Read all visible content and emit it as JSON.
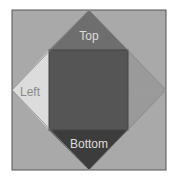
{
  "diagram": {
    "labels": {
      "top": "Top",
      "left": "Left",
      "right": "Right",
      "bottom": "Bottom"
    },
    "colors": {
      "outer_square": "#a9a9a9",
      "top_triangle": "#6e6e6e",
      "left_triangle": "#dcdcdc",
      "right_triangle": "#9a9a9a",
      "bottom_triangle": "#3c3c3c",
      "center_square": "#555555",
      "label_text_light": "#dddddd"
    }
  }
}
